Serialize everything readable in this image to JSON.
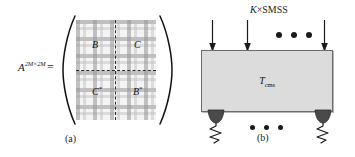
{
  "figure": {
    "panel_a": {
      "equation_symbol": "A",
      "equation_superscript": "2M×2M",
      "equals": "=",
      "blocks": [
        {
          "name": "top-left",
          "label": "B",
          "star": ""
        },
        {
          "name": "top-right",
          "label": "C",
          "star": ""
        },
        {
          "name": "bottom-left",
          "label": "C",
          "star": "*"
        },
        {
          "name": "bottom-right",
          "label": "B",
          "star": "*"
        }
      ],
      "caption": "(a)",
      "colors": {
        "plaid_dark": "#969696",
        "plaid_light": "#bebebe",
        "background": "#f4f4f4",
        "dashed_line": "#2b2b2b"
      }
    },
    "panel_b": {
      "load_label_italic": "K",
      "load_label_rest": "×SMSS",
      "arrow_count_shown": 3,
      "arrow_ellipsis": "• • •",
      "structure_label_main": "T",
      "structure_label_sub": "cms",
      "support_ellipsis": "• • •",
      "caption": "(b)",
      "colors": {
        "block_fill": "#dcdcdc",
        "block_border": "#6a6a6a",
        "support_fill": "#4a4a4a",
        "arrow": "#1a1a1a"
      }
    }
  }
}
